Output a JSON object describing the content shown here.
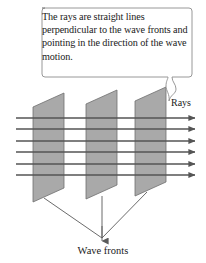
{
  "figure": {
    "background_color": "#ffffff",
    "callout": {
      "text": "The rays are straight lines perpendicular to the wave fronts and pointing in the direction of the wave motion.",
      "border_color": "#8c8c8c",
      "fill_color": "#ffffff",
      "text_color": "#1a1a1a"
    },
    "labels": {
      "rays": "Rays",
      "wave_fronts": "Wave fronts"
    },
    "wave_fronts": {
      "count": 3,
      "fill_color": "#a9a9a9",
      "stroke_color": "#6e6e6e"
    },
    "rays": {
      "count": 6,
      "color": "#555555",
      "direction": "right",
      "arrowhead": "filled-triangle"
    },
    "leader_lines": {
      "count": 3,
      "color": "#5a5a5a",
      "converge_to_label": "Wave fronts"
    }
  }
}
